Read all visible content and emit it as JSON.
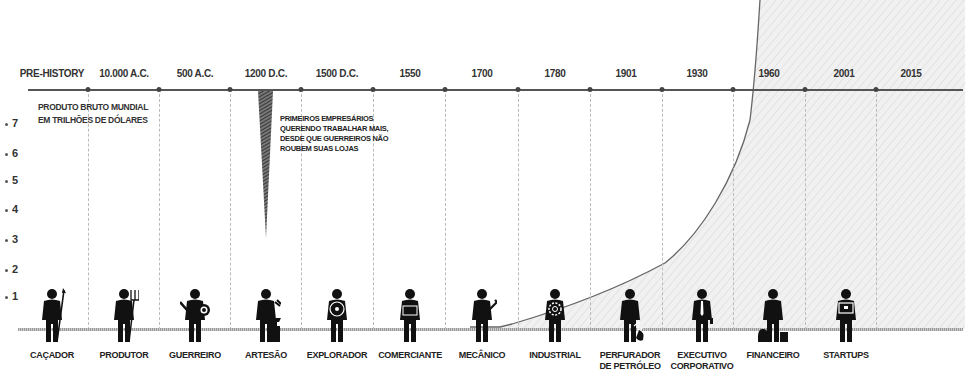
{
  "chart_data": {
    "type": "area",
    "title": "",
    "ylabel": "PRODUTO BRUTO MUNDIAL EM TRILHÕES DE DÓLARES",
    "ylim": [
      0,
      7
    ],
    "yticks": [
      "1",
      "2",
      "3",
      "4",
      "5",
      "6",
      "7"
    ],
    "categories": [
      "PRE-HISTORY",
      "10.000 A.C.",
      "500 A.C.",
      "1200 D.C.",
      "1500 D.C.",
      "1550",
      "1700",
      "1780",
      "1901",
      "1930",
      "1960",
      "2001",
      "2015"
    ],
    "series": [
      {
        "name": "Produto Bruto Mundial",
        "values": [
          0,
          0,
          0,
          0,
          0,
          0,
          0,
          0.1,
          0.8,
          2.3,
          8,
          8,
          8
        ]
      }
    ],
    "annotations": [
      {
        "text": "PRIMEIROS EMPRESÁRIOS QUERENDO TRABALHAR MAIS, DESDE QUE GUERREIROS NÃO ROUBEM SUAS LOJAS",
        "x": "1200 D.C."
      }
    ],
    "occupations": [
      "CAÇADOR",
      "PRODUTOR",
      "GUERREIRO",
      "ARTESÃO",
      "EXPLORADOR",
      "COMERCIANTE",
      "MECÂNICO",
      "INDUSTRIAL",
      "PERFURADOR DE PETRÓLEO",
      "EXECUTIVO CORPORATIVO",
      "FINANCEIRO",
      "STARTUPS"
    ],
    "grid": false,
    "legend": "none"
  },
  "eras": [
    {
      "label": "PRE-HISTORY",
      "x": 52
    },
    {
      "label": "10.000 A.C.",
      "x": 124
    },
    {
      "label": "500 A.C.",
      "x": 195
    },
    {
      "label": "1200 D.C.",
      "x": 266
    },
    {
      "label": "1500 D.C.",
      "x": 337
    },
    {
      "label": "1550",
      "x": 410
    },
    {
      "label": "1700",
      "x": 482
    },
    {
      "label": "1780",
      "x": 555
    },
    {
      "label": "1901",
      "x": 626
    },
    {
      "label": "1930",
      "x": 697
    },
    {
      "label": "1960",
      "x": 769
    },
    {
      "label": "2001",
      "x": 844
    },
    {
      "label": "2015",
      "x": 911
    }
  ],
  "axis_dots": [
    88,
    159,
    230,
    301,
    373,
    445,
    518,
    590,
    662,
    733,
    805,
    876
  ],
  "y_axis": {
    "title_line1": "PRODUTO BRUTO MUNDIAL",
    "title_line2": "EM TRILHÕES DE DÓLARES",
    "ticks": [
      {
        "label": "7",
        "y": 124
      },
      {
        "label": "6",
        "y": 154
      },
      {
        "label": "5",
        "y": 181
      },
      {
        "label": "4",
        "y": 210
      },
      {
        "label": "3",
        "y": 240
      },
      {
        "label": "2",
        "y": 270
      },
      {
        "label": "1",
        "y": 297
      }
    ]
  },
  "annotation": {
    "line1": "PRIMEIROS EMPRESÁRIOS",
    "line2": "QUERENDO TRABALHAR MAIS,",
    "line3": "DESDE QUE GUERREIROS NÃO",
    "line4": "ROUBEM SUAS LOJAS"
  },
  "occupations": [
    {
      "line1": "CAÇADOR",
      "line2": "",
      "x": 52,
      "icon": "hunter-spear"
    },
    {
      "line1": "PRODUTOR",
      "line2": "",
      "x": 124,
      "icon": "farmer-pitchfork"
    },
    {
      "line1": "GUERREIRO",
      "line2": "",
      "x": 195,
      "icon": "warrior-shield"
    },
    {
      "line1": "ARTESÃO",
      "line2": "",
      "x": 266,
      "icon": "artisan-anvil"
    },
    {
      "line1": "EXPLORADOR",
      "line2": "",
      "x": 337,
      "icon": "explorer-compass"
    },
    {
      "line1": "COMERCIANTE",
      "line2": "",
      "x": 410,
      "icon": "merchant-apron"
    },
    {
      "line1": "MECÂNICO",
      "line2": "",
      "x": 482,
      "icon": "mechanic-wrench"
    },
    {
      "line1": "INDUSTRIAL",
      "line2": "",
      "x": 555,
      "icon": "industrial-gear"
    },
    {
      "line1": "PERFURADOR",
      "line2": "DE PETRÓLEO",
      "x": 630,
      "icon": "oil-driller"
    },
    {
      "line1": "EXECUTIVO",
      "line2": "CORPORATIVO",
      "x": 702,
      "icon": "executive-tie"
    },
    {
      "line1": "FINANCEIRO",
      "line2": "",
      "x": 773,
      "icon": "financier-moneybag"
    },
    {
      "line1": "STARTUPS",
      "line2": "",
      "x": 846,
      "icon": "startup-laptop"
    }
  ],
  "colors": {
    "axis": "#555555",
    "curve": "#666666",
    "fill": "#ececec",
    "figure": "#111111",
    "spike": "#444444"
  }
}
